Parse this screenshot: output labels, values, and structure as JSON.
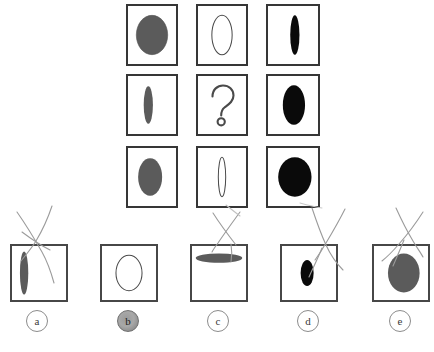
{
  "puzzle": {
    "type": "matrix-reasoning",
    "missing_cell": {
      "row": 2,
      "col": 2,
      "symbol": "?"
    },
    "colors": {
      "gray_fill": "#5b5b5b",
      "black_fill": "#0a0a0a",
      "white_fill": "#ffffff",
      "outline": "#4a4a4a",
      "cell_border": "#363636",
      "pencil": "#9b9b9b"
    },
    "grid": {
      "rows": 3,
      "cols": 3,
      "cells": [
        {
          "id": "cell-r1c1",
          "row": 1,
          "col": 1,
          "shape": "ellipse",
          "fill": "gray",
          "rx": 17,
          "ry": 21,
          "label": "gray wide ellipse"
        },
        {
          "id": "cell-r1c2",
          "row": 1,
          "col": 2,
          "shape": "ellipse",
          "fill": "white",
          "rx": 11,
          "ry": 21,
          "label": "outlined ellipse"
        },
        {
          "id": "cell-r1c3",
          "row": 1,
          "col": 3,
          "shape": "ellipse",
          "fill": "black",
          "rx": 5,
          "ry": 21,
          "label": "black narrow ellipse"
        },
        {
          "id": "cell-r2c1",
          "row": 2,
          "col": 1,
          "shape": "ellipse",
          "fill": "gray",
          "rx": 5,
          "ry": 20,
          "label": "gray narrow ellipse"
        },
        {
          "id": "cell-r2c2",
          "row": 2,
          "col": 2,
          "shape": "question",
          "fill": "none",
          "rx": 0,
          "ry": 0,
          "label": "question mark"
        },
        {
          "id": "cell-r2c3",
          "row": 2,
          "col": 3,
          "shape": "ellipse",
          "fill": "black",
          "rx": 12,
          "ry": 21,
          "label": "black medium ellipse"
        },
        {
          "id": "cell-r3c1",
          "row": 3,
          "col": 1,
          "shape": "ellipse",
          "fill": "gray",
          "rx": 13,
          "ry": 20,
          "label": "gray medium ellipse"
        },
        {
          "id": "cell-r3c2",
          "row": 3,
          "col": 2,
          "shape": "ellipse",
          "fill": "white",
          "rx": 4,
          "ry": 21,
          "label": "outlined very narrow ellipse"
        },
        {
          "id": "cell-r3c3",
          "row": 3,
          "col": 3,
          "shape": "ellipse",
          "fill": "black",
          "rx": 18,
          "ry": 21,
          "label": "black wide ellipse"
        }
      ]
    },
    "options": [
      {
        "id": "option-a",
        "letter": "a",
        "shape": "ellipse",
        "fill": "gray",
        "rx": 4.5,
        "ry": 23,
        "cx_frac": 0.2,
        "marked": false,
        "crossed_out": true,
        "label": "gray very narrow ellipse"
      },
      {
        "id": "option-b",
        "letter": "b",
        "shape": "ellipse",
        "fill": "white",
        "rx": 14,
        "ry": 19,
        "cx_frac": 0.5,
        "marked": true,
        "crossed_out": false,
        "label": "outlined medium ellipse"
      },
      {
        "id": "option-c",
        "letter": "c",
        "shape": "ellipse",
        "fill": "gray",
        "rx": 25,
        "ry": 5,
        "cx_frac": 0.5,
        "marked": false,
        "crossed_out": true,
        "label": "gray flat horizontal ellipse"
      },
      {
        "id": "option-d",
        "letter": "d",
        "shape": "ellipse",
        "fill": "black",
        "rx": 7,
        "ry": 14,
        "cx_frac": 0.47,
        "marked": false,
        "crossed_out": true,
        "label": "black narrow ellipse"
      },
      {
        "id": "option-e",
        "letter": "e",
        "shape": "ellipse",
        "fill": "gray",
        "rx": 17,
        "ry": 21,
        "cx_frac": 0.55,
        "marked": false,
        "crossed_out": true,
        "label": "gray wide ellipse"
      }
    ],
    "selected_option": "b"
  }
}
